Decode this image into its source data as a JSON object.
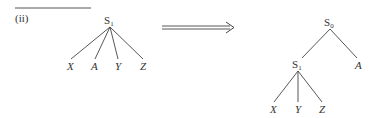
{
  "label": "(ii)",
  "left_tree": {
    "root": {
      "base": "S",
      "sub": "1"
    },
    "leaves": [
      "X",
      "A",
      "Y",
      "Z"
    ]
  },
  "arrow": "double-arrow-right",
  "right_tree": {
    "root": {
      "base": "S",
      "sub": "0"
    },
    "child": {
      "base": "S",
      "sub": "1"
    },
    "right_leaf": "A",
    "child_leaves": [
      "X",
      "Y",
      "Z"
    ]
  },
  "colors": {
    "line": "#444444",
    "text": "#333333"
  }
}
